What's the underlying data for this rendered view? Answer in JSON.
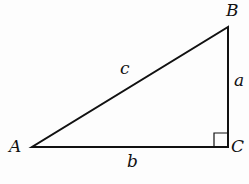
{
  "diagram": {
    "vertices": {
      "A": "A",
      "B": "B",
      "C": "C"
    },
    "sides": {
      "a": "a",
      "b": "b",
      "c": "c"
    },
    "right_angle_at": "C",
    "stroke_color": "#111111"
  }
}
